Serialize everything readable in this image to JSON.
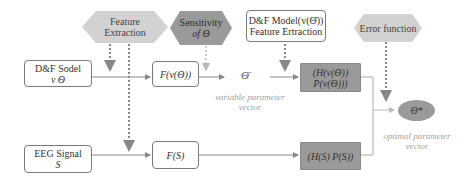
{
  "diagram": {
    "top_labels": {
      "feature_extraction": "Feature Extraction",
      "feature_extraction_line1": "Feature",
      "feature_extraction_line2": "Extraction",
      "sensitivity_line1": "Sensitivity",
      "sensitivity_line2": "of Θ",
      "df_model_line1": "D&F Model(v(Θ̄))",
      "df_model_line2": "Feature Ertraction",
      "error_function": "Error function"
    },
    "nodes": {
      "df_sodel_line1": "D&F Sodel",
      "df_sodel_line2": "v  Θ",
      "f_v_theta": "F(v(Θ))",
      "theta_bar": "Θ̄",
      "h_p_v_line1": "(H(v(Θ))",
      "h_p_v_line2": "P(v(Θ)))",
      "theta_star": "Θ*",
      "eeg_line1": "EEG Signal",
      "eeg_line2": "S",
      "f_s": "F(S)",
      "h_p_s": "(H(S)  P(S))"
    },
    "captions": {
      "variable_line1": "variable parameter",
      "variable_line2": "vector",
      "optimal_line1": "optimal parameter",
      "optimal_line2": "vector"
    },
    "colors": {
      "hex_light": "#d2d2d2",
      "hex_dark": "#9a9a9a",
      "grey_box": "#9a9a9a",
      "border": "#7a7a7a",
      "caption": "#a0a0a0"
    }
  }
}
